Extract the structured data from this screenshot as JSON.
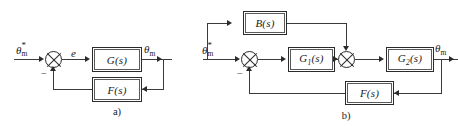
{
  "figure": {
    "type": "control-system-block-diagram",
    "panel_count": 2,
    "line_color": "#2b2b2b",
    "background": "#ffffff"
  },
  "panel_a": {
    "caption": "a)",
    "input_label": {
      "base": "θ",
      "superscript": "*",
      "subscript": "m"
    },
    "error_label": "e",
    "output_label": {
      "base": "θ",
      "subscript": "m"
    },
    "summer": {
      "name": "summing-junction",
      "negative_sign": "−"
    },
    "blocks": [
      {
        "id": "forward",
        "label": "G(s)"
      },
      {
        "id": "feedback",
        "label": "F(s)"
      }
    ]
  },
  "panel_b": {
    "caption": "b)",
    "input_label": {
      "base": "θ",
      "superscript": "*",
      "subscript": "m"
    },
    "output_label": {
      "base": "θ",
      "subscript": "m"
    },
    "summers": [
      {
        "id": "input-summer",
        "negative_sign": "−"
      },
      {
        "id": "mid-summer",
        "negative_sign": ""
      }
    ],
    "blocks": [
      {
        "id": "feedforward",
        "label": "B(s)"
      },
      {
        "id": "forward-1",
        "label": "G",
        "sub": "1",
        "suffix": "(s)"
      },
      {
        "id": "forward-2",
        "label": "G",
        "sub": "2",
        "suffix": "(s)"
      },
      {
        "id": "feedback",
        "label": "F(s)"
      }
    ]
  }
}
